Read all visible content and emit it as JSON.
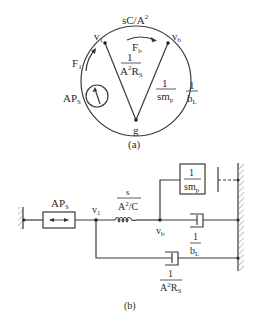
{
  "figure_a": {
    "caption": "(a)",
    "nodes": {
      "v1": "v",
      "v1_sub": "1",
      "vb": "v",
      "vb_sub": "b",
      "g": "g"
    },
    "top_branch": {
      "label": "sC/A",
      "sup": "2"
    },
    "flow_b": {
      "label": "F",
      "sub": "b"
    },
    "flow_1": {
      "label": "F",
      "sub": "1"
    },
    "source": {
      "label": "AP",
      "sub": "S"
    },
    "left_diag": {
      "num": "1",
      "den_a": "A",
      "den_sup": "2",
      "den_b": "R",
      "den_sub": "S"
    },
    "right_diag": {
      "num": "1",
      "den": "sm",
      "den_sub": "p"
    },
    "right_arc": {
      "num": "1",
      "den": "b",
      "den_sub": "L"
    }
  },
  "figure_b": {
    "caption": "(b)",
    "source_box": {
      "label": "AP",
      "sub": "S"
    },
    "node_v1": {
      "label": "v",
      "sub": "1"
    },
    "node_vb": {
      "label": "v",
      "sub": "b"
    },
    "inductor": {
      "num": "s",
      "den_a": "A",
      "den_sup": "2",
      "den_b": "/C"
    },
    "mass": {
      "num": "1",
      "den": "sm",
      "den_sub": "p"
    },
    "damper_bl": {
      "num": "1",
      "den": "b",
      "den_sub": "L"
    },
    "damper_rs": {
      "num": "1",
      "den_a": "A",
      "den_sup": "2",
      "den_b": "R",
      "den_sub": "S"
    }
  }
}
